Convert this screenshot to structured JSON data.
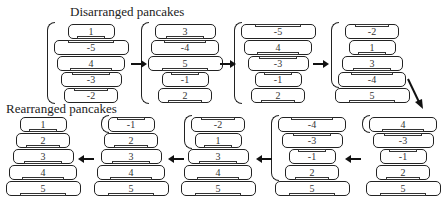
{
  "labels": {
    "top": "Disarranged pancakes",
    "bottom": "Rearranged pancakes"
  },
  "stacks": [
    {
      "id": 1,
      "pancakes": [
        "1",
        "-5",
        "4",
        "-3",
        "-2"
      ],
      "bracket_count": 5
    },
    {
      "id": 2,
      "pancakes": [
        "3",
        "-4",
        "5",
        "-1",
        "2"
      ],
      "bracket_count": 5
    },
    {
      "id": 3,
      "pancakes": [
        "-5",
        "4",
        "-3",
        "-1",
        "2"
      ],
      "bracket_count": 5
    },
    {
      "id": 4,
      "pancakes": [
        "-2",
        "1",
        "3",
        "-4",
        "5"
      ],
      "bracket_count": 4
    },
    {
      "id": 5,
      "pancakes": [
        "4",
        "-3",
        "-1",
        "2",
        "5"
      ],
      "bracket_count": 1
    },
    {
      "id": 6,
      "pancakes": [
        "-4",
        "-3",
        "-1",
        "2",
        "5"
      ],
      "bracket_count": 4
    },
    {
      "id": 7,
      "pancakes": [
        "-2",
        "1",
        "3",
        "4",
        "5"
      ],
      "bracket_count": 2
    },
    {
      "id": 8,
      "pancakes": [
        "-1",
        "2",
        "3",
        "4",
        "5"
      ],
      "bracket_count": 1
    },
    {
      "id": 9,
      "pancakes": [
        "1",
        "2",
        "3",
        "4",
        "5"
      ],
      "bracket_count": 0
    }
  ],
  "flow": [
    "1 → 2",
    "2 → 3",
    "3 → 4",
    "4 ↘ 5",
    "5 ← 6",
    "6 ← 7",
    "7 ← 8",
    "8 ← 9"
  ]
}
